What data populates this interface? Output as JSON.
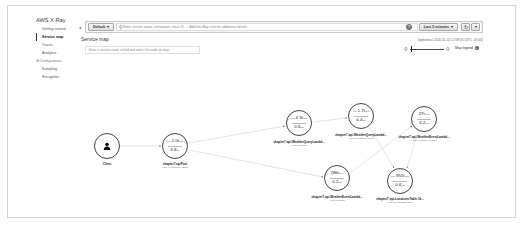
{
  "sidebar": {
    "title": "AWS X-Ray",
    "items": [
      {
        "label": "Getting started",
        "active": false
      },
      {
        "label": "Service map",
        "active": true
      },
      {
        "label": "Traces",
        "active": false
      },
      {
        "label": "Analytics",
        "active": false
      },
      {
        "label": "⊟ Configuration",
        "section": true
      },
      {
        "label": "Sampling",
        "active": false
      },
      {
        "label": "Encryption",
        "active": false
      }
    ],
    "collapse_icon": "◂"
  },
  "toolbar": {
    "group_label": "Default",
    "group_caret": "▾",
    "search_icon": "⚲",
    "search_placeholder": "Enter service name, annotation, trace ID. ⓘ Add the Map icon for additional details",
    "help_icon": "?",
    "time_range_label": "Last 5 minutes",
    "time_caret": "▾",
    "refresh_icon": "↻",
    "more_caret": "▾"
  },
  "header": {
    "title": "Service map",
    "updated": "Updated at 2020-01-02 12:58:05 (UTC -05:00)"
  },
  "filter": {
    "placeholder": "Enter a service name to find and select the node on map"
  },
  "zoom_controls": {
    "zoom_out_icon": "⚲",
    "zoom_in_icon": "⚲",
    "legend_label": "Map legend",
    "legend_icon": "+"
  },
  "map": {
    "nodes": [
      {
        "id": "client",
        "label": "Client",
        "type": "",
        "icon": "👤"
      },
      {
        "id": "apigw",
        "label": "chapter7-apiPost",
        "type": "AWS::ApiGateway::Stage",
        "line1": "2.0t",
        "line1_prefix": "avg",
        "line1_unit": "/min",
        "line2": "3.8",
        "line2_unit": "ms"
      },
      {
        "id": "wq_lambda",
        "label": "chapter7-api-WeatherQueryLambd...",
        "type": "AWS::Lambda",
        "line1": "4.3t",
        "line1_prefix": "avg",
        "line1_unit": "/min",
        "line2": "0.6",
        "line2_unit": "ms"
      },
      {
        "id": "wq_func",
        "label": "chapter7-api-WeatherQueryLambd...",
        "type": "AWS::Lambda::Function",
        "line1": "1.7t",
        "line1_prefix": "avg",
        "line1_unit": "/min",
        "line2": "0.4",
        "line2_unit": "ms"
      },
      {
        "id": "we_func",
        "label": "chapter7-api-WeatherEventLambd...",
        "type": "AWS::Lambda::Function",
        "line1": "27t",
        "line1_prefix": "",
        "line1_unit": "/min",
        "line2": "0.2",
        "line2_unit": "ms"
      },
      {
        "id": "we_lambda",
        "label": "chapter7-api-WeatherEventLambd...",
        "type": "AWS::Lambda",
        "line1": "286t",
        "line1_prefix": "",
        "line1_unit": "/min",
        "line2": "0.2",
        "line2_unit": "ms"
      },
      {
        "id": "ddb",
        "label": "chapter7-api-LocationsTable-1k...",
        "type": "AWS::DynamoDB::Table",
        "line1": "951t",
        "line1_prefix": "avg",
        "line1_unit": "/min",
        "line2": "0.6",
        "line2_unit": "ms"
      }
    ]
  }
}
